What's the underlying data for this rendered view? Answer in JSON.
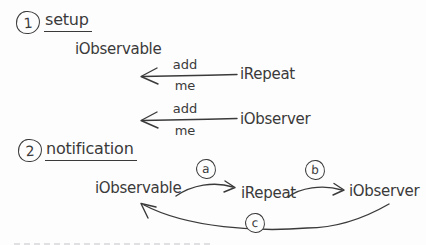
{
  "canvas": {
    "bg": "#fdfdfd",
    "ink": "#3a3a3a"
  },
  "setup": {
    "number": "1",
    "title": "setup",
    "observable": "iObservable",
    "calls": [
      {
        "label_top": "add",
        "label_bottom": "me",
        "caller": "iRepeat"
      },
      {
        "label_top": "add",
        "label_bottom": "me",
        "caller": "iObserver"
      }
    ]
  },
  "notification": {
    "number": "2",
    "title": "notification",
    "nodes": [
      {
        "label": "iObservable"
      },
      {
        "label": "iRepeat"
      },
      {
        "label": "iObserver"
      }
    ],
    "edges": [
      {
        "id": "a",
        "from": "iObservable",
        "to": "iRepeat"
      },
      {
        "id": "b",
        "from": "iRepeat",
        "to": "iObserver"
      },
      {
        "id": "c",
        "from": "iObserver",
        "to": "iObservable"
      }
    ]
  }
}
